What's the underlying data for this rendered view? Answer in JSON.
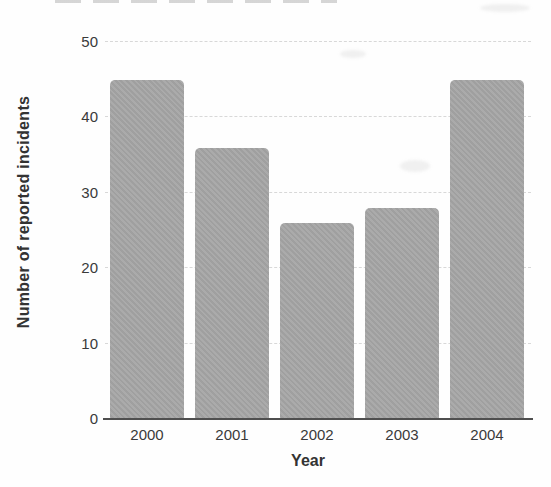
{
  "chart_data": {
    "type": "bar",
    "categories": [
      "2000",
      "2001",
      "2002",
      "2003",
      "2004"
    ],
    "values": [
      45,
      36,
      26,
      28,
      45
    ],
    "title": "",
    "xlabel": "Year",
    "ylabel": "Number of reported incidents",
    "ylim": [
      0,
      50
    ],
    "yticks": [
      0,
      10,
      20,
      30,
      40,
      50
    ],
    "grid": true,
    "legend": "none",
    "bar_color": "#a6a6a6",
    "axis_color": "#4f4f4f",
    "text_color": "#3a3a3a",
    "gridline_color": "#d8d8d8"
  }
}
